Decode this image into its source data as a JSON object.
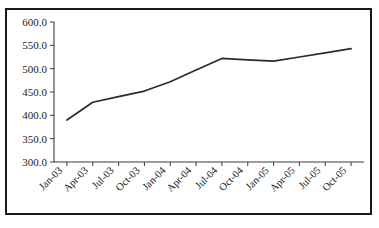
{
  "chart_data": {
    "type": "line",
    "title": "",
    "xlabel": "",
    "ylabel": "",
    "grid": false,
    "legend": false,
    "ylim": [
      300.0,
      600.0
    ],
    "ytick_step": 50.0,
    "ytick_labels": [
      "600.0",
      "550.0",
      "500.0",
      "450.0",
      "400.0",
      "350.0",
      "300.0"
    ],
    "ytick_values": [
      600.0,
      550.0,
      500.0,
      450.0,
      400.0,
      350.0,
      300.0
    ],
    "categories": [
      "Jan-03",
      "Apr-03",
      "Jul-03",
      "Oct-03",
      "Jan-04",
      "Apr-04",
      "Jul-04",
      "Oct-04",
      "Jan-05",
      "Apr-05",
      "Jul-05",
      "Oct-05"
    ],
    "values": [
      390,
      428,
      440,
      452,
      472,
      497,
      522,
      519,
      516,
      525,
      534,
      543
    ],
    "series": [
      {
        "name": "series-1",
        "values": [
          390,
          428,
          440,
          452,
          472,
          497,
          522,
          519,
          516,
          525,
          534,
          543
        ]
      }
    ]
  },
  "frame": {
    "clipped_title": ""
  }
}
